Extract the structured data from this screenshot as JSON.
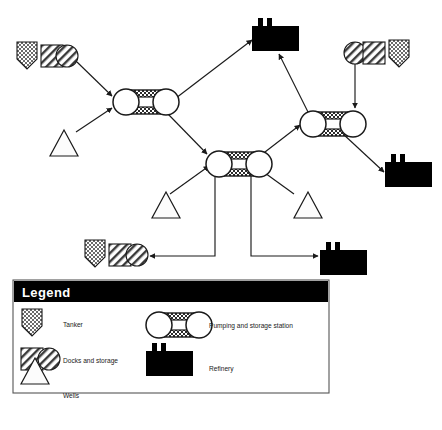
{
  "diagram": {
    "type": "flow-network",
    "colors": {
      "stroke": "#1a1a1a",
      "fill_black": "#000000",
      "fill_white": "#ffffff",
      "hatch": "#4a4a4a",
      "legend_header_bg": "#000000",
      "legend_header_text": "#ffffff",
      "legend_border": "#555555"
    },
    "nodes": [
      {
        "id": "dock-group-topleft",
        "type": "docks-and-storage-group",
        "label": "Docks and storage with tanker",
        "x": 17,
        "y": 42
      },
      {
        "id": "well-left",
        "type": "wells",
        "label": "Wells",
        "x": 50,
        "y": 130
      },
      {
        "id": "pump-left",
        "type": "pumping-and-storage-station",
        "label": "Pumping and storage station",
        "x": 112,
        "y": 88
      },
      {
        "id": "refinery-top",
        "type": "refinery",
        "label": "Refinery",
        "x": 252,
        "y": 18
      },
      {
        "id": "pump-center",
        "type": "pumping-and-storage-station",
        "label": "Pumping and storage station",
        "x": 205,
        "y": 150
      },
      {
        "id": "pump-right",
        "type": "pumping-and-storage-station",
        "label": "Pumping and storage station",
        "x": 299,
        "y": 110
      },
      {
        "id": "dock-group-topright",
        "type": "docks-and-storage-group",
        "label": "Docks and storage with tanker",
        "x": 344,
        "y": 40
      },
      {
        "id": "refinery-right",
        "type": "refinery",
        "label": "Refinery",
        "x": 385,
        "y": 154
      },
      {
        "id": "well-center-left",
        "type": "wells",
        "label": "Wells",
        "x": 152,
        "y": 192
      },
      {
        "id": "well-center-right",
        "type": "wells",
        "label": "Wells",
        "x": 294,
        "y": 192
      },
      {
        "id": "dock-group-bottom",
        "type": "docks-and-storage-group",
        "label": "Docks and storage with tanker",
        "x": 85,
        "y": 240
      },
      {
        "id": "refinery-bottom",
        "type": "refinery",
        "label": "Refinery",
        "x": 320,
        "y": 242
      }
    ],
    "edges": [
      {
        "from": "dock-group-topleft",
        "to": "pump-left",
        "arrow": true
      },
      {
        "from": "well-left",
        "to": "pump-left",
        "arrow": true
      },
      {
        "from": "pump-left",
        "to": "refinery-top",
        "arrow": true
      },
      {
        "from": "pump-left",
        "to": "pump-center",
        "arrow": true
      },
      {
        "from": "pump-right",
        "to": "refinery-top",
        "arrow": true
      },
      {
        "from": "dock-group-topright",
        "to": "pump-right",
        "arrow": true
      },
      {
        "from": "pump-center",
        "to": "pump-right",
        "arrow": true
      },
      {
        "from": "pump-right",
        "to": "refinery-right",
        "arrow": true
      },
      {
        "from": "well-center-left",
        "to": "pump-center",
        "arrow": true
      },
      {
        "from": "well-center-right",
        "to": "pump-center",
        "arrow": true
      },
      {
        "from": "pump-center",
        "to": "dock-group-bottom",
        "arrow": true
      },
      {
        "from": "pump-center",
        "to": "refinery-bottom",
        "arrow": true
      }
    ]
  },
  "legend": {
    "title": "Legend",
    "entries": [
      {
        "symbol": "tanker-icon",
        "label": "Tanker"
      },
      {
        "symbol": "pumping-station-icon",
        "label": "Pumping and storage station"
      },
      {
        "symbol": "docks-and-storage-icon",
        "label": "Docks and storage"
      },
      {
        "symbol": "refinery-icon",
        "label": "Refinery"
      },
      {
        "symbol": "wells-icon",
        "label": "Wells"
      }
    ]
  }
}
